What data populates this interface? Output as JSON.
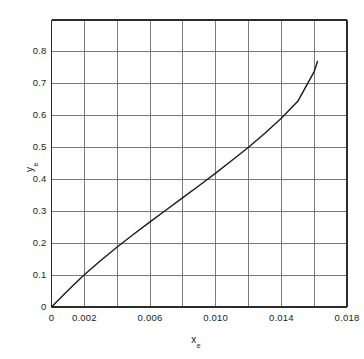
{
  "chart_data": {
    "type": "line",
    "title": "",
    "subtitle": "",
    "xlabel": "x",
    "xlabel_sub": "e",
    "ylabel": "y",
    "ylabel_sub": "e",
    "xlim": [
      0,
      0.018
    ],
    "ylim": [
      0,
      0.9
    ],
    "grid": true,
    "legend": "none",
    "x_major_step": 0.002,
    "y_major_step": 0.1,
    "x_tick_positions": [
      0,
      0.002,
      0.004,
      0.006,
      0.008,
      0.01,
      0.012,
      0.014,
      0.016,
      0.018
    ],
    "y_tick_positions": [
      0,
      0.1,
      0.2,
      0.3,
      0.4,
      0.5,
      0.6,
      0.7,
      0.8,
      0.9
    ],
    "x_tick_labels": [
      {
        "value": 0,
        "text": "0"
      },
      {
        "value": 0.002,
        "text": "0.002"
      },
      {
        "value": 0.006,
        "text": "0.006"
      },
      {
        "value": 0.01,
        "text": "0.010"
      },
      {
        "value": 0.014,
        "text": "0.014"
      },
      {
        "value": 0.018,
        "text": "0.018"
      }
    ],
    "y_tick_labels": [
      {
        "value": 0,
        "text": "0"
      },
      {
        "value": 0.1,
        "text": "0.1"
      },
      {
        "value": 0.2,
        "text": "0.2"
      },
      {
        "value": 0.3,
        "text": "0.3"
      },
      {
        "value": 0.4,
        "text": "0.4"
      },
      {
        "value": 0.5,
        "text": "0.5"
      },
      {
        "value": 0.6,
        "text": "0.6"
      },
      {
        "value": 0.7,
        "text": "0.7"
      },
      {
        "value": 0.8,
        "text": "0.8"
      }
    ],
    "series": [
      {
        "name": "equilibrium-curve",
        "color": "#1a1a1a",
        "line_width": 1.4,
        "x": [
          0,
          0.0005,
          0.001,
          0.0015,
          0.002,
          0.003,
          0.004,
          0.005,
          0.006,
          0.007,
          0.008,
          0.009,
          0.01,
          0.011,
          0.012,
          0.013,
          0.014,
          0.015,
          0.016,
          0.0162
        ],
        "y": [
          0,
          0.026,
          0.052,
          0.077,
          0.101,
          0.146,
          0.188,
          0.228,
          0.267,
          0.305,
          0.343,
          0.381,
          0.42,
          0.46,
          0.501,
          0.545,
          0.592,
          0.645,
          0.738,
          0.77
        ]
      }
    ],
    "colors": {
      "frame": "#2b2b2b",
      "grid": "#6e6e6e",
      "curve": "#1a1a1a",
      "text": "#1c1c1c",
      "background": "#ffffff"
    }
  }
}
